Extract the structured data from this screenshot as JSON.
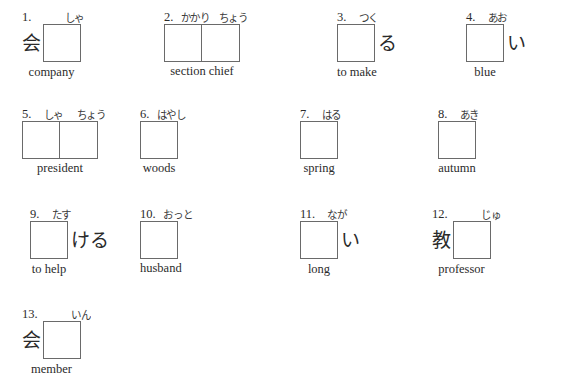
{
  "worksheet": {
    "background_color": "#ffffff",
    "ink_color": "#2b2b2b",
    "box_border_color": "#6a6a6a",
    "items": [
      {
        "number": "1.",
        "prefix": "会",
        "suffix": "",
        "boxes": 1,
        "furigana": [
          "しゃ"
        ],
        "gloss": "company"
      },
      {
        "number": "2.",
        "prefix": "",
        "suffix": "",
        "boxes": 2,
        "furigana": [
          "かかり",
          "ちょう"
        ],
        "gloss": "section chief"
      },
      {
        "number": "3.",
        "prefix": "",
        "suffix": "る",
        "boxes": 1,
        "furigana": [
          "つく"
        ],
        "gloss": "to make"
      },
      {
        "number": "4.",
        "prefix": "",
        "suffix": "い",
        "boxes": 1,
        "furigana": [
          "あお"
        ],
        "gloss": "blue"
      },
      {
        "number": "5.",
        "prefix": "",
        "suffix": "",
        "boxes": 2,
        "furigana": [
          "しゃ",
          "ちょう"
        ],
        "gloss": "president"
      },
      {
        "number": "6.",
        "prefix": "",
        "suffix": "",
        "boxes": 1,
        "furigana": [
          "はやし"
        ],
        "gloss": "woods"
      },
      {
        "number": "7.",
        "prefix": "",
        "suffix": "",
        "boxes": 1,
        "furigana": [
          "はる"
        ],
        "gloss": "spring"
      },
      {
        "number": "8.",
        "prefix": "",
        "suffix": "",
        "boxes": 1,
        "furigana": [
          "あき"
        ],
        "gloss": "autumn"
      },
      {
        "number": "9.",
        "prefix": "",
        "suffix": "ける",
        "boxes": 1,
        "furigana": [
          "たす"
        ],
        "gloss": "to help"
      },
      {
        "number": "10.",
        "prefix": "",
        "suffix": "",
        "boxes": 1,
        "furigana": [
          "おっと"
        ],
        "gloss": "husband"
      },
      {
        "number": "11.",
        "prefix": "",
        "suffix": "い",
        "boxes": 1,
        "furigana": [
          "なが"
        ],
        "gloss": "long"
      },
      {
        "number": "12.",
        "prefix": "教",
        "suffix": "",
        "boxes": 1,
        "furigana": [
          "じゅ"
        ],
        "gloss": "professor"
      },
      {
        "number": "13.",
        "prefix": "会",
        "suffix": "",
        "boxes": 1,
        "furigana": [
          "いん"
        ],
        "gloss": "member"
      }
    ],
    "layout": [
      {
        "left": 22,
        "top": 8
      },
      {
        "left": 164,
        "top": 8
      },
      {
        "left": 337,
        "top": 8
      },
      {
        "left": 466,
        "top": 8
      },
      {
        "left": 22,
        "top": 105
      },
      {
        "left": 140,
        "top": 105
      },
      {
        "left": 300,
        "top": 105
      },
      {
        "left": 438,
        "top": 105
      },
      {
        "left": 30,
        "top": 205
      },
      {
        "left": 140,
        "top": 205
      },
      {
        "left": 300,
        "top": 205
      },
      {
        "left": 432,
        "top": 205
      },
      {
        "left": 22,
        "top": 305
      }
    ]
  }
}
